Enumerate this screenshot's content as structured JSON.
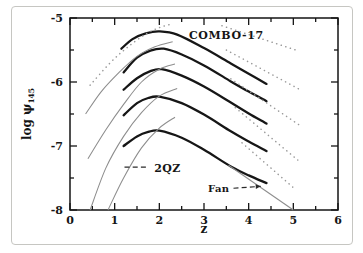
{
  "figure": {
    "background": "#ffffff",
    "border_color": "#c6c6c2",
    "curve_color_thick": "#161616",
    "curve_color_thin": "#8d8d8d",
    "curve_color_dotted": "#9a9a9a",
    "text_color": "#151515"
  },
  "chart_data": {
    "type": "line",
    "title": "",
    "xlabel": "z",
    "ylabel": "log ψ",
    "ylabel_subscript": "145",
    "xlim": [
      0,
      6
    ],
    "ylim": [
      -8,
      -5
    ],
    "x_major_ticks": [
      0,
      1,
      2,
      3,
      4,
      5,
      6
    ],
    "x_tick_labels": [
      "0",
      "1",
      "2",
      "3",
      "4",
      "5",
      "6"
    ],
    "x_minor_step": 0.5,
    "y_major_ticks": [
      -5,
      -6,
      -7,
      -8
    ],
    "y_tick_labels": [
      "-5",
      "-6",
      "-7",
      "-8"
    ],
    "y_minor_step": 0.5,
    "grid": false,
    "legend_position": "none",
    "series": [
      {
        "name": "combo17-bin1",
        "style": "thick",
        "points": [
          [
            1.15,
            -5.48
          ],
          [
            1.4,
            -5.33
          ],
          [
            1.7,
            -5.24
          ],
          [
            2.0,
            -5.21
          ],
          [
            2.4,
            -5.26
          ],
          [
            3.0,
            -5.47
          ],
          [
            3.6,
            -5.71
          ],
          [
            4.0,
            -5.87
          ],
          [
            4.4,
            -6.03
          ]
        ]
      },
      {
        "name": "combo17-bin2",
        "style": "thick",
        "points": [
          [
            1.2,
            -5.85
          ],
          [
            1.5,
            -5.62
          ],
          [
            1.8,
            -5.51
          ],
          [
            2.1,
            -5.48
          ],
          [
            2.5,
            -5.57
          ],
          [
            3.0,
            -5.74
          ],
          [
            3.6,
            -5.99
          ],
          [
            4.0,
            -6.15
          ],
          [
            4.4,
            -6.3
          ]
        ]
      },
      {
        "name": "combo17-bin3",
        "style": "thick",
        "points": [
          [
            1.2,
            -6.12
          ],
          [
            1.5,
            -5.94
          ],
          [
            1.8,
            -5.83
          ],
          [
            2.05,
            -5.8
          ],
          [
            2.5,
            -5.9
          ],
          [
            3.0,
            -6.07
          ],
          [
            3.6,
            -6.32
          ],
          [
            4.0,
            -6.49
          ],
          [
            4.4,
            -6.65
          ]
        ]
      },
      {
        "name": "combo17-bin4",
        "style": "thick",
        "points": [
          [
            1.2,
            -6.52
          ],
          [
            1.5,
            -6.33
          ],
          [
            1.75,
            -6.25
          ],
          [
            2.0,
            -6.23
          ],
          [
            2.5,
            -6.33
          ],
          [
            3.0,
            -6.51
          ],
          [
            3.6,
            -6.77
          ],
          [
            4.0,
            -6.93
          ],
          [
            4.4,
            -7.08
          ]
        ]
      },
      {
        "name": "combo17-bin5",
        "style": "thick",
        "points": [
          [
            1.2,
            -7.0
          ],
          [
            1.5,
            -6.85
          ],
          [
            1.75,
            -6.78
          ],
          [
            2.0,
            -6.76
          ],
          [
            2.5,
            -6.87
          ],
          [
            3.0,
            -7.06
          ],
          [
            3.6,
            -7.32
          ],
          [
            4.0,
            -7.46
          ],
          [
            4.4,
            -7.58
          ]
        ]
      },
      {
        "name": "2qz-bin2",
        "style": "thin",
        "points": [
          [
            0.35,
            -6.5
          ],
          [
            0.7,
            -6.15
          ],
          [
            1.1,
            -5.85
          ],
          [
            1.5,
            -5.6
          ],
          [
            1.9,
            -5.45
          ],
          [
            2.3,
            -5.37
          ]
        ]
      },
      {
        "name": "2qz-bin3",
        "style": "thin",
        "points": [
          [
            0.4,
            -7.2
          ],
          [
            0.8,
            -6.75
          ],
          [
            1.2,
            -6.35
          ],
          [
            1.6,
            -6.0
          ],
          [
            2.0,
            -5.8
          ],
          [
            2.35,
            -5.72
          ]
        ]
      },
      {
        "name": "2qz-bin4",
        "style": "thin",
        "points": [
          [
            0.45,
            -8.0
          ],
          [
            0.8,
            -7.35
          ],
          [
            1.2,
            -6.85
          ],
          [
            1.6,
            -6.48
          ],
          [
            2.0,
            -6.22
          ],
          [
            2.4,
            -6.1
          ]
        ]
      },
      {
        "name": "2qz-bin5",
        "style": "thin",
        "points": [
          [
            0.85,
            -8.0
          ],
          [
            1.2,
            -7.5
          ],
          [
            1.6,
            -7.03
          ],
          [
            2.0,
            -6.72
          ],
          [
            2.35,
            -6.55
          ]
        ]
      },
      {
        "name": "dotted-left-bin1",
        "style": "dotted",
        "points": [
          [
            0.45,
            -6.05
          ],
          [
            0.9,
            -5.7
          ],
          [
            1.3,
            -5.45
          ],
          [
            1.7,
            -5.25
          ],
          [
            2.0,
            -5.15
          ],
          [
            2.25,
            -5.1
          ]
        ]
      },
      {
        "name": "dotted-right-1",
        "style": "dotted",
        "points": [
          [
            3.4,
            -5.12
          ],
          [
            5.05,
            -5.5
          ]
        ]
      },
      {
        "name": "dotted-right-2",
        "style": "dotted",
        "points": [
          [
            3.5,
            -5.5
          ],
          [
            5.15,
            -6.12
          ]
        ]
      },
      {
        "name": "dotted-right-3",
        "style": "dotted",
        "points": [
          [
            3.6,
            -5.95
          ],
          [
            5.15,
            -6.68
          ]
        ]
      },
      {
        "name": "dotted-right-4",
        "style": "dotted",
        "points": [
          [
            3.7,
            -6.4
          ],
          [
            5.1,
            -7.22
          ]
        ]
      },
      {
        "name": "dotted-right-5",
        "style": "dotted",
        "points": [
          [
            3.85,
            -6.95
          ],
          [
            5.05,
            -7.68
          ]
        ]
      },
      {
        "name": "fan-line",
        "style": "fan",
        "points": [
          [
            3.55,
            -7.3
          ],
          [
            5.0,
            -8.0
          ]
        ]
      }
    ],
    "annotations": [
      {
        "id": "combo17-label",
        "text": "COMBO-17",
        "z": 3.5,
        "v": -5.28,
        "anchor": "middle",
        "size": 11,
        "letter_spacing": 0.6
      },
      {
        "id": "2qz-label",
        "text": "2QZ",
        "z": 2.18,
        "v": -7.35,
        "anchor": "middle",
        "size": 11,
        "letter_spacing": 0.4
      },
      {
        "id": "fan-label",
        "text": "Fan",
        "z": 3.33,
        "v": -7.66,
        "anchor": "middle",
        "size": 10,
        "letter_spacing": 0.4
      }
    ],
    "annotation_lines": [
      {
        "id": "2qz-key-dash",
        "from": [
          1.22,
          -7.33
        ],
        "to": [
          1.76,
          -7.33
        ],
        "dashed": true,
        "arrow": false
      },
      {
        "id": "fan-key-dash",
        "from": [
          3.66,
          -7.66
        ],
        "to": [
          4.27,
          -7.63
        ],
        "dashed": true,
        "arrow": true
      }
    ]
  }
}
